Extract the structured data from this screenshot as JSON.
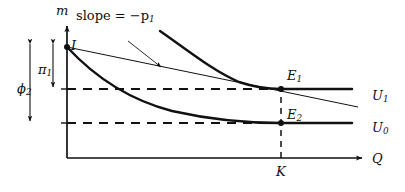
{
  "figure": {
    "type": "economics-indifference-curve-diagram",
    "background_color": "#ffffff",
    "line_color": "#111111",
    "axes": {
      "y_axis_label": "m",
      "x_axis_label": "Q",
      "origin_px": [
        67,
        158
      ],
      "y_axis_top_px": 23,
      "x_axis_right_px": 366
    },
    "labels": {
      "m": "m",
      "Q": "Q",
      "I": "I",
      "K": "K",
      "pi_1": "π",
      "pi_1_sub": "1",
      "phi_2": "ϕ",
      "phi_2_sub": "2",
      "E_1": "E",
      "E_1_sub": "1",
      "E_2": "E",
      "E_2_sub": "2",
      "U_1": "U",
      "U_1_sub": "1",
      "U_0": "U",
      "U_0_sub": "0",
      "slope_text": "slope = −p",
      "slope_sub": "1"
    },
    "annotations": [
      {
        "name": "slope-annotation",
        "text": "slope = −p₁",
        "points_to": "budget-line",
        "arrow_from_px": [
          130,
          43
        ],
        "arrow_to_px": [
          160,
          67
        ]
      }
    ],
    "points": [
      {
        "name": "I",
        "label": "I",
        "x_px": 67,
        "y_px": 47,
        "description": "income endowment on m-axis"
      },
      {
        "name": "E1",
        "label": "E₁",
        "x_px": 281,
        "y_px": 89,
        "description": "tangency of budget line with U₁"
      },
      {
        "name": "E2",
        "label": "E₂",
        "x_px": 281,
        "y_px": 123,
        "description": "point on U₀ at quantity K"
      }
    ],
    "curves": [
      {
        "name": "U0",
        "label": "U₀",
        "style": "thick-solid",
        "description": "lower indifference curve through I and E₂",
        "path_px": "M 67,47 C 95,75 130,100 175,112 C 215,121 250,123 281,123 L 352,123"
      },
      {
        "name": "U1",
        "label": "U₁",
        "style": "thick-solid",
        "description": "upper indifference curve tangent to budget line at E₁",
        "path_px": "M 160,31 C 188,50 215,72 240,82 C 258,88 270,89 281,89 L 352,89"
      },
      {
        "name": "budget-line",
        "label": "slope = −p₁",
        "style": "thin-solid",
        "description": "budget line from I tangent to U₁ at E₁",
        "path_px": "M 67,47 L 358,107"
      }
    ],
    "guide_lines": [
      {
        "name": "phi2-dashed-upper",
        "orientation": "horizontal",
        "y_px": 89,
        "x_from_px": 67,
        "x_to_px": 281
      },
      {
        "name": "dashed-lower",
        "orientation": "horizontal",
        "y_px": 123,
        "x_from_px": 67,
        "x_to_px": 281
      },
      {
        "name": "K-dashed-vertical",
        "orientation": "vertical",
        "x_px": 281,
        "y_from_px": 89,
        "y_to_px": 158
      }
    ],
    "measure_arrows": [
      {
        "name": "phi2-measure",
        "label": "ϕ₂",
        "x_px": 30,
        "y_from_px": 42,
        "y_to_px": 123,
        "double_headed": true
      },
      {
        "name": "pi1-measure",
        "label": "π₁",
        "x_px": 53,
        "y_from_px": 42,
        "y_to_px": 89,
        "double_headed": true
      }
    ]
  }
}
